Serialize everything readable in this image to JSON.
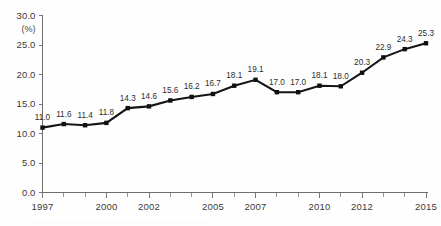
{
  "chart_data": {
    "type": "line",
    "title": "",
    "xlabel": "",
    "ylabel": "",
    "unit_label": "(%)",
    "x": [
      1997,
      1998,
      1999,
      2000,
      2001,
      2002,
      2003,
      2004,
      2005,
      2006,
      2007,
      2008,
      2009,
      2010,
      2011,
      2012,
      2013,
      2014,
      2015
    ],
    "values": [
      11.0,
      11.6,
      11.4,
      11.8,
      14.3,
      14.6,
      15.6,
      16.2,
      16.7,
      18.1,
      19.1,
      17.0,
      17.0,
      18.1,
      18.0,
      20.3,
      22.9,
      24.3,
      25.3
    ],
    "point_labels": [
      "11.0",
      "11.6",
      "11.4",
      "11.8",
      "14.3",
      "14.6",
      "15.6",
      "16.2",
      "16.7",
      "18.1",
      "19.1",
      "17.0",
      "17.0",
      "18.1",
      "18.0",
      "20.3",
      "22.9",
      "24.3",
      "25.3"
    ],
    "ylim": [
      0.0,
      30.0
    ],
    "ytick_values": [
      0.0,
      5.0,
      10.0,
      15.0,
      20.0,
      25.0,
      30.0
    ],
    "ytick_labels": [
      "0.0",
      "5.0",
      "10.0",
      "15.0",
      "20.0",
      "25.0",
      "30.0"
    ],
    "xtick_values": [
      1997,
      1998,
      1999,
      2000,
      2001,
      2002,
      2003,
      2004,
      2005,
      2006,
      2007,
      2008,
      2009,
      2010,
      2011,
      2012,
      2013,
      2014,
      2015
    ],
    "xtick_labeled": [
      1997,
      2000,
      2002,
      2005,
      2007,
      2010,
      2012,
      2015
    ],
    "xtick_labels": [
      "1997",
      "2000",
      "2002",
      "2005",
      "2007",
      "2010",
      "2012",
      "2015"
    ],
    "grid": false,
    "legend": null,
    "series_color": "#151515",
    "axis_color": "#6d6d6d",
    "marker": "square"
  }
}
